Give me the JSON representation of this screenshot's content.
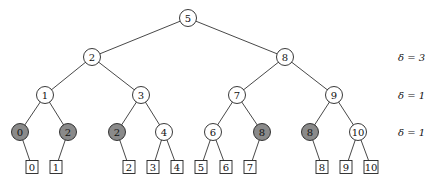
{
  "diagram": {
    "type": "binary-search-tree",
    "colors": {
      "node_fill": "#ffffff",
      "highlight_fill": "#8a8a8a",
      "stroke": "#222222"
    },
    "nodes": [
      {
        "id": "n5",
        "label": "5",
        "x": 188,
        "y": 18,
        "shaded": false
      },
      {
        "id": "n2",
        "label": "2",
        "x": 92,
        "y": 57,
        "shaded": false
      },
      {
        "id": "n8",
        "label": "8",
        "x": 285,
        "y": 57,
        "shaded": false
      },
      {
        "id": "n1",
        "label": "1",
        "x": 45,
        "y": 95,
        "shaded": false
      },
      {
        "id": "n3",
        "label": "3",
        "x": 141,
        "y": 95,
        "shaded": false
      },
      {
        "id": "n7",
        "label": "7",
        "x": 237,
        "y": 95,
        "shaded": false
      },
      {
        "id": "n9",
        "label": "9",
        "x": 334,
        "y": 95,
        "shaded": false
      },
      {
        "id": "n0a",
        "label": "0",
        "x": 20,
        "y": 132,
        "shaded": true
      },
      {
        "id": "n2a",
        "label": "2",
        "x": 68,
        "y": 132,
        "shaded": true
      },
      {
        "id": "n2b",
        "label": "2",
        "x": 117,
        "y": 132,
        "shaded": true
      },
      {
        "id": "n4",
        "label": "4",
        "x": 164,
        "y": 132,
        "shaded": false
      },
      {
        "id": "n6",
        "label": "6",
        "x": 213,
        "y": 132,
        "shaded": false
      },
      {
        "id": "n8a",
        "label": "8",
        "x": 262,
        "y": 132,
        "shaded": true
      },
      {
        "id": "n8b",
        "label": "8",
        "x": 310,
        "y": 132,
        "shaded": true
      },
      {
        "id": "n10",
        "label": "10",
        "x": 358,
        "y": 132,
        "shaded": false
      }
    ],
    "leaves": [
      {
        "id": "l0",
        "label": "0",
        "x": 32,
        "y": 167
      },
      {
        "id": "l1",
        "label": "1",
        "x": 56,
        "y": 167
      },
      {
        "id": "l2",
        "label": "2",
        "x": 129,
        "y": 167
      },
      {
        "id": "l3",
        "label": "3",
        "x": 153,
        "y": 167
      },
      {
        "id": "l4",
        "label": "4",
        "x": 177,
        "y": 167
      },
      {
        "id": "l5",
        "label": "5",
        "x": 201,
        "y": 167
      },
      {
        "id": "l6",
        "label": "6",
        "x": 226,
        "y": 167
      },
      {
        "id": "l7",
        "label": "7",
        "x": 250,
        "y": 167
      },
      {
        "id": "l8",
        "label": "8",
        "x": 322,
        "y": 167
      },
      {
        "id": "l9",
        "label": "9",
        "x": 346,
        "y": 167
      },
      {
        "id": "l10",
        "label": "10",
        "x": 371,
        "y": 167
      }
    ],
    "edges": [
      [
        "n5",
        "n2"
      ],
      [
        "n5",
        "n8"
      ],
      [
        "n2",
        "n1"
      ],
      [
        "n2",
        "n3"
      ],
      [
        "n8",
        "n7"
      ],
      [
        "n8",
        "n9"
      ],
      [
        "n1",
        "n0a"
      ],
      [
        "n1",
        "n2a"
      ],
      [
        "n3",
        "n2b"
      ],
      [
        "n3",
        "n4"
      ],
      [
        "n7",
        "n6"
      ],
      [
        "n7",
        "n8a"
      ],
      [
        "n9",
        "n8b"
      ],
      [
        "n9",
        "n10"
      ],
      [
        "n0a",
        "l0"
      ],
      [
        "n2a",
        "l1"
      ],
      [
        "n2b",
        "l2"
      ],
      [
        "n4",
        "l3"
      ],
      [
        "n4",
        "l4"
      ],
      [
        "n6",
        "l5"
      ],
      [
        "n6",
        "l6"
      ],
      [
        "n8a",
        "l7"
      ],
      [
        "n8b",
        "l8"
      ],
      [
        "n10",
        "l9"
      ],
      [
        "n10",
        "l10"
      ]
    ],
    "delta_labels": [
      {
        "text": "δ = 3",
        "x": 398,
        "y": 57
      },
      {
        "text": "δ = 1",
        "x": 398,
        "y": 95
      },
      {
        "text": "δ = 1",
        "x": 398,
        "y": 132
      }
    ]
  }
}
